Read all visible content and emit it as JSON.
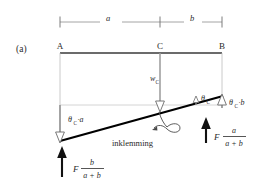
{
  "figure": {
    "panel_label": "(a)",
    "type": "beam-deflection-diagram",
    "colors": {
      "beam": "#3a3a3a",
      "deflected_line": "#000000",
      "thin_line": "#a8a8a8",
      "dimension_line": "#8f8f8f",
      "text": "#2b2b2b",
      "background": "#ffffff"
    },
    "dimensions": {
      "span_a_label": "a",
      "span_b_label": "b"
    },
    "nodes": {
      "left_label": "A",
      "mid_label": "C",
      "right_label": "B"
    },
    "annotations": {
      "deflection_label": "w",
      "deflection_sub": "C",
      "rotation_left_theta": "θ",
      "rotation_left_sub": "C",
      "rotation_left_rest": "·a",
      "rotation_right_theta": "θ",
      "rotation_right_sub": "C",
      "rotation_right_rest": "·b",
      "angle_theta": "θ",
      "angle_sub": "C",
      "clamp_label": "inklemming"
    },
    "forces": {
      "left": {
        "symbol": "F",
        "numerator": "b",
        "denominator": "a + b"
      },
      "right": {
        "symbol": "F",
        "numerator": "a",
        "denominator": "a + b"
      }
    }
  }
}
